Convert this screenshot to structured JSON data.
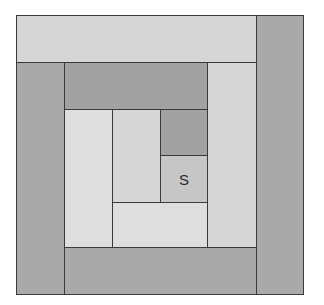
{
  "diagram": {
    "type": "log-cabin-quilt-block",
    "outer": {
      "x": 16,
      "y": 15,
      "w": 288,
      "h": 280
    },
    "colors": {
      "light": "#d6d6d6",
      "lighter": "#dedede",
      "medium": "#c6c6c6",
      "dark": "#a9a9a9",
      "darker": "#a2a2a2",
      "border": "#3a3a3a"
    },
    "pieces": [
      {
        "id": "top-strip",
        "x": 16,
        "y": 15,
        "w": 241,
        "h": 48,
        "tone": "light",
        "label": ""
      },
      {
        "id": "right-strip",
        "x": 256,
        "y": 15,
        "w": 48,
        "h": 280,
        "tone": "dark",
        "label": ""
      },
      {
        "id": "left-strip",
        "x": 16,
        "y": 62,
        "w": 49,
        "h": 233,
        "tone": "dark",
        "label": ""
      },
      {
        "id": "bottom-strip",
        "x": 64,
        "y": 247,
        "w": 193,
        "h": 48,
        "tone": "dark",
        "label": ""
      },
      {
        "id": "top-inner-strip",
        "x": 64,
        "y": 62,
        "w": 144,
        "h": 48,
        "tone": "darker",
        "label": ""
      },
      {
        "id": "right-inner-strip",
        "x": 207,
        "y": 62,
        "w": 50,
        "h": 186,
        "tone": "light",
        "label": ""
      },
      {
        "id": "left-inner-strip",
        "x": 64,
        "y": 109,
        "w": 49,
        "h": 139,
        "tone": "lighter",
        "label": ""
      },
      {
        "id": "bottom-inner-strip",
        "x": 112,
        "y": 202,
        "w": 96,
        "h": 46,
        "tone": "lighter",
        "label": ""
      },
      {
        "id": "center-left-strip",
        "x": 112,
        "y": 109,
        "w": 49,
        "h": 94,
        "tone": "light",
        "label": ""
      },
      {
        "id": "dark-square",
        "x": 160,
        "y": 109,
        "w": 48,
        "h": 47,
        "tone": "darker",
        "label": ""
      },
      {
        "id": "start-square",
        "x": 160,
        "y": 155,
        "w": 48,
        "h": 48,
        "tone": "medium",
        "label": "S"
      }
    ]
  }
}
